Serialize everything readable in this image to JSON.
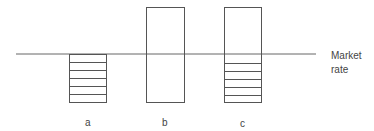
{
  "diagram": {
    "market_rate_label_line1": "Market",
    "market_rate_label_line2": "rate",
    "bars": [
      {
        "label": "a"
      },
      {
        "label": "b"
      },
      {
        "label": "c"
      }
    ]
  },
  "colors": {
    "stroke": "#555555",
    "text": "#444444",
    "background": "#ffffff"
  }
}
